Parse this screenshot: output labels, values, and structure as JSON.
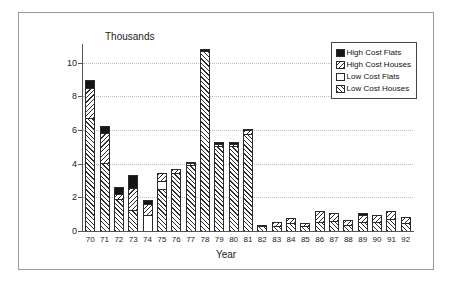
{
  "chart_data": {
    "type": "bar",
    "subtype": "stacked",
    "title": "",
    "xlabel": "Year",
    "ylabel": "Thousands",
    "ylim": [
      0,
      11
    ],
    "yticks": [
      0,
      2,
      4,
      6,
      8,
      10
    ],
    "ytick_labels": [
      "0",
      "2",
      "4",
      "6",
      "8",
      "10"
    ],
    "grid": "horizontal-dotted",
    "legend_position": "top-right",
    "categories": [
      "70",
      "71",
      "72",
      "73",
      "74",
      "75",
      "76",
      "77",
      "78",
      "79",
      "80",
      "81",
      "82",
      "83",
      "84",
      "85",
      "86",
      "87",
      "88",
      "89",
      "90",
      "91",
      "92"
    ],
    "series": [
      {
        "name": "Low Cost Houses",
        "pattern": "forward-hatch",
        "values": [
          6.7,
          4.05,
          1.9,
          1.25,
          0.0,
          2.5,
          3.45,
          3.9,
          10.7,
          5.05,
          5.05,
          5.75,
          0.28,
          0.3,
          0.45,
          0.28,
          0.55,
          0.6,
          0.35,
          0.55,
          0.55,
          0.7,
          0.45
        ]
      },
      {
        "name": "Low Cost Flats",
        "pattern": "solid-white",
        "values": [
          0.0,
          0.0,
          0.0,
          0.0,
          0.95,
          0.5,
          0.0,
          0.0,
          0.0,
          0.0,
          0.0,
          0.0,
          0.0,
          0.0,
          0.0,
          0.0,
          0.0,
          0.0,
          0.0,
          0.0,
          0.0,
          0.0,
          0.0
        ]
      },
      {
        "name": "High Cost Houses",
        "pattern": "back-hatch",
        "values": [
          1.8,
          1.8,
          0.3,
          1.3,
          0.65,
          0.45,
          0.25,
          0.15,
          0.0,
          0.15,
          0.15,
          0.25,
          0.02,
          0.25,
          0.3,
          0.17,
          0.65,
          0.45,
          0.3,
          0.4,
          0.4,
          0.5,
          0.4
        ]
      },
      {
        "name": "High Cost Flats",
        "pattern": "solid-black",
        "values": [
          0.5,
          0.4,
          0.4,
          0.8,
          0.25,
          0.0,
          0.0,
          0.05,
          0.15,
          0.05,
          0.05,
          0.05,
          0.0,
          0.0,
          0.0,
          0.0,
          0.0,
          0.0,
          0.0,
          0.15,
          0.0,
          0.0,
          0.0
        ]
      }
    ],
    "legend_entries": [
      {
        "label": "High Cost Flats",
        "pattern": "solid-black"
      },
      {
        "label": "High Cost Houses",
        "pattern": "back-hatch"
      },
      {
        "label": "Low Cost Flats",
        "pattern": "solid-white"
      },
      {
        "label": "Low Cost Houses",
        "pattern": "forward-hatch"
      }
    ],
    "colors": {
      "ink": "#151515",
      "axis": "#555555",
      "grid": "#bdbdbd",
      "background": "#ffffff",
      "frame": "#9a9a9a"
    }
  }
}
